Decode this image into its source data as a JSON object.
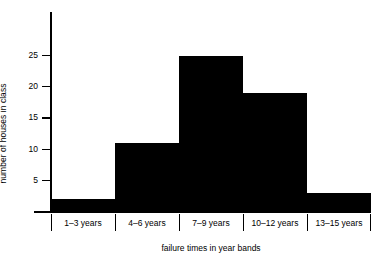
{
  "chart_data": {
    "type": "bar",
    "title": "",
    "subtitle": "",
    "xlabel": "failure times in year bands",
    "ylabel": "number of houses in class",
    "categories": [
      "1–3 years",
      "4–6 years",
      "7–9 years",
      "10–12 years",
      "13–15 years"
    ],
    "values": [
      2,
      11,
      25,
      19,
      3
    ],
    "ylim": [
      0,
      32
    ],
    "yticks": [
      5,
      10,
      15,
      20,
      25
    ],
    "ytick_labels": [
      "5",
      "10",
      "15",
      "20",
      "25"
    ],
    "grid": false,
    "legend": false,
    "legend_position": "none",
    "bar_color": "#000000",
    "axis_color": "#000000",
    "background_color": "#ffffff",
    "series": [
      {
        "name": "houses",
        "values": [
          2,
          11,
          25,
          19,
          3
        ]
      }
    ]
  }
}
